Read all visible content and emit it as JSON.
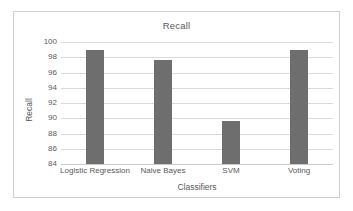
{
  "figure": {
    "border_color": "#cfcfcf",
    "background": "#ffffff"
  },
  "chart_data": {
    "type": "bar",
    "title": "Recall",
    "xlabel": "Classifiers",
    "ylabel": "Recall",
    "categories": [
      "Logistic Regression",
      "Naive Bayes",
      "SVM",
      "Voting"
    ],
    "values": [
      98.9,
      97.7,
      89.6,
      98.9
    ],
    "ylim": [
      84,
      100
    ],
    "yticks": [
      84,
      86,
      88,
      90,
      92,
      94,
      96,
      98,
      100
    ],
    "ytick_labels": [
      "84",
      "86",
      "88",
      "90",
      "92",
      "94",
      "96",
      "98",
      "100"
    ],
    "grid": true,
    "legend": false,
    "bar_color": "#6e6e6e",
    "gridline_color": "#d9d9d9",
    "text_color": "#5a5a5a"
  }
}
